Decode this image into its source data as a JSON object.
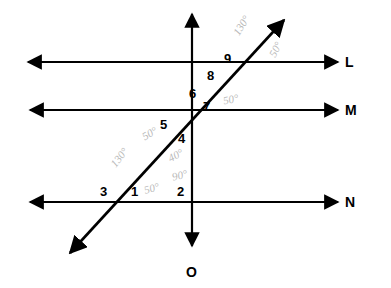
{
  "figure": {
    "background_color": "#ffffff",
    "ink_color": "#000000",
    "pencil_color": "#b9b9b9"
  },
  "line_labels": [
    {
      "name": "line-label-L",
      "text": "L",
      "x": 345,
      "y": 55
    },
    {
      "name": "line-label-M",
      "text": "M",
      "x": 345,
      "y": 103
    },
    {
      "name": "line-label-N",
      "text": "N",
      "x": 345,
      "y": 195
    },
    {
      "name": "line-label-O",
      "text": "O",
      "x": 186,
      "y": 265
    }
  ],
  "angle_numbers": [
    {
      "name": "angle-number-1",
      "text": "1",
      "x": 131,
      "y": 185
    },
    {
      "name": "angle-number-2",
      "text": "2",
      "x": 177,
      "y": 185
    },
    {
      "name": "angle-number-3",
      "text": "3",
      "x": 100,
      "y": 185
    },
    {
      "name": "angle-number-4",
      "text": "4",
      "x": 178,
      "y": 132
    },
    {
      "name": "angle-number-5",
      "text": "5",
      "x": 160,
      "y": 118
    },
    {
      "name": "angle-number-6",
      "text": "6",
      "x": 189,
      "y": 87
    },
    {
      "name": "angle-number-7",
      "text": "7",
      "x": 203,
      "y": 100
    },
    {
      "name": "angle-number-8",
      "text": "8",
      "x": 207,
      "y": 69
    },
    {
      "name": "angle-number-9",
      "text": "9",
      "x": 224,
      "y": 52
    }
  ],
  "pencil_annotations": [
    {
      "name": "pencil-angle-130-top",
      "text": "130°",
      "x": 231,
      "y": 20,
      "rotate": -58
    },
    {
      "name": "pencil-angle-50-top",
      "text": "50°",
      "x": 268,
      "y": 44,
      "rotate": -62
    },
    {
      "name": "pencil-angle-50-near-7",
      "text": "50°",
      "x": 223,
      "y": 94,
      "rotate": -12
    },
    {
      "name": "pencil-angle-50-near-5",
      "text": "50°",
      "x": 142,
      "y": 128,
      "rotate": -30
    },
    {
      "name": "pencil-angle-130-left",
      "text": "130°",
      "x": 109,
      "y": 152,
      "rotate": -52
    },
    {
      "name": "pencil-angle-40-near-4",
      "text": "40°",
      "x": 168,
      "y": 150,
      "rotate": -28
    },
    {
      "name": "pencil-angle-90-near-2",
      "text": "90°",
      "x": 172,
      "y": 170,
      "rotate": -14
    },
    {
      "name": "pencil-angle-50-near-1",
      "text": "50°",
      "x": 144,
      "y": 183,
      "rotate": -16
    }
  ],
  "geometry": {
    "horizontal_lines": [
      {
        "name": "line-L",
        "y": 62,
        "x_start": 28,
        "x_end": 338
      },
      {
        "name": "line-M",
        "y": 110,
        "x_start": 30,
        "x_end": 338
      },
      {
        "name": "line-N",
        "y": 202,
        "x_start": 30,
        "x_end": 338
      }
    ],
    "vertical_line": {
      "name": "line-O",
      "x": 192,
      "y_start": 14,
      "y_end": 246
    },
    "transversal": {
      "name": "transversal-line",
      "x1": 70,
      "y1": 253,
      "x2": 284,
      "y2": 20
    },
    "intersections": [
      {
        "name": "intersection-transversal-L",
        "x": 215,
        "y": 62
      },
      {
        "name": "intersection-center",
        "x": 192,
        "y": 110
      },
      {
        "name": "intersection-transversal-N",
        "x": 122,
        "y": 202
      }
    ]
  }
}
